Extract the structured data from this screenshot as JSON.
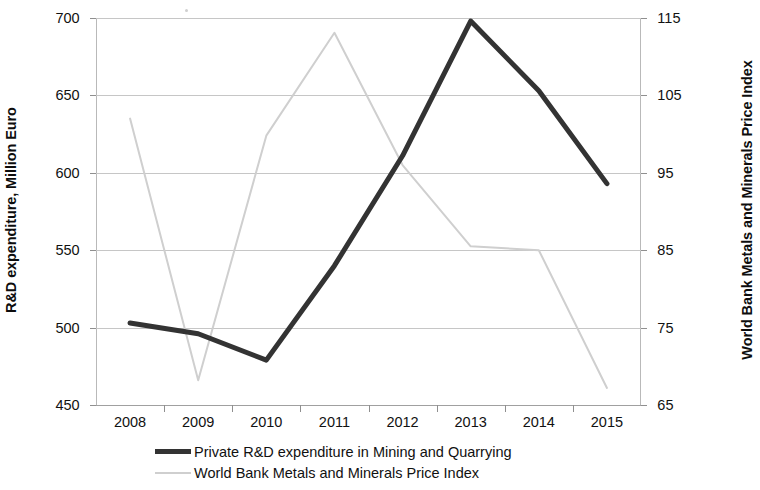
{
  "chart_data": {
    "type": "line",
    "title": "",
    "xlabel": "",
    "categories": [
      "2008",
      "2009",
      "2010",
      "2011",
      "2012",
      "2013",
      "2014",
      "2015"
    ],
    "grid": true,
    "legend_position": "bottom",
    "axes": {
      "left": {
        "label": "R&D expenditure, Million Euro",
        "ticks": [
          "450",
          "500",
          "550",
          "600",
          "650",
          "700"
        ],
        "tick_values": [
          450,
          500,
          550,
          600,
          650,
          700
        ],
        "ylim": [
          450,
          700
        ]
      },
      "right": {
        "label": "World Bank Metals and Minerals Price Index",
        "ticks": [
          "65",
          "75",
          "85",
          "95",
          "105",
          "115"
        ],
        "tick_values": [
          65,
          75,
          85,
          95,
          105,
          115
        ],
        "ylim": [
          65,
          115
        ]
      }
    },
    "series": [
      {
        "name": "Private R&D expenditure in Mining and Quarrying",
        "axis": "left",
        "color": "#333333",
        "width": 5,
        "values": [
          503,
          496,
          479,
          540,
          611,
          698,
          653,
          593
        ]
      },
      {
        "name": "World Bank Metals and Minerals Price Index",
        "axis": "right",
        "color": "#cfcfcf",
        "width": 2,
        "values": [
          102,
          68.2,
          99.8,
          113.1,
          96,
          85.5,
          85,
          67.2
        ]
      }
    ]
  },
  "legend": {
    "items": [
      {
        "label": "Private R&D expenditure in Mining and Quarrying"
      },
      {
        "label": "World Bank Metals and Minerals Price Index"
      }
    ]
  }
}
